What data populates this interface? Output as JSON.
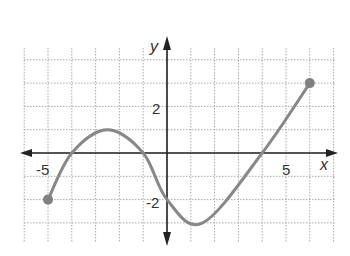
{
  "chart_data": {
    "type": "line",
    "title": "",
    "xlabel": "x",
    "ylabel": "y",
    "xlim": [
      -6,
      7
    ],
    "ylim": [
      -4,
      4
    ],
    "x_ticks_labeled": [
      -5,
      5
    ],
    "y_ticks_labeled": [
      2,
      -2
    ],
    "tick_labels": {
      "x_neg": "-5",
      "x_pos": "5",
      "y_pos": "2",
      "y_neg": "-2"
    },
    "grid": true,
    "grid_style": "dotted",
    "grid_step": 1,
    "series": [
      {
        "name": "f(x)",
        "color": "#888888",
        "points": [
          {
            "x": -5,
            "y": -2
          },
          {
            "x": -4,
            "y": 0
          },
          {
            "x": -2.5,
            "y": 1
          },
          {
            "x": -1,
            "y": 0
          },
          {
            "x": 0,
            "y": -2
          },
          {
            "x": 1.5,
            "y": -3
          },
          {
            "x": 4,
            "y": 0
          },
          {
            "x": 6,
            "y": 3
          }
        ],
        "endpoints": [
          {
            "x": -5,
            "y": -2,
            "closed": true
          },
          {
            "x": 6,
            "y": 3,
            "closed": true
          }
        ]
      }
    ],
    "colors": {
      "axis": "#222222",
      "grid": "#aaaaaa",
      "curve": "#888888",
      "endpoint": "#808080"
    }
  }
}
